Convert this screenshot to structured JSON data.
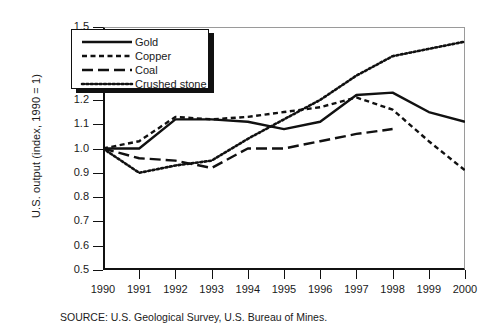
{
  "chart_data": {
    "type": "line",
    "title": "",
    "xlabel": "",
    "ylabel": "U.S. output (index, 1990 = 1)",
    "x": [
      1990,
      1991,
      1992,
      1993,
      1994,
      1995,
      1996,
      1997,
      1998,
      1999,
      2000
    ],
    "xlim": [
      1990,
      2000
    ],
    "ylim": [
      0.5,
      1.5
    ],
    "yticks": [
      "1.5",
      "1.4",
      "1.3",
      "1.2",
      "1.1",
      "1.0",
      "0.9",
      "0.8",
      "0.7",
      "0.6",
      "0.5"
    ],
    "xticks": [
      "1990",
      "1991",
      "1992",
      "1993",
      "1994",
      "1995",
      "1996",
      "1997",
      "1998",
      "1999",
      "2000"
    ],
    "grid": false,
    "legend_position": "upper-left",
    "series": [
      {
        "name": "Gold",
        "style": "solid",
        "color": "#111111",
        "x": [
          1990,
          1991,
          1992,
          1993,
          1994,
          1995,
          1996,
          1997,
          1998,
          1999,
          2000
        ],
        "values": [
          1.0,
          1.0,
          1.12,
          1.12,
          1.11,
          1.08,
          1.11,
          1.22,
          1.23,
          1.15,
          1.11
        ]
      },
      {
        "name": "Copper",
        "style": "dashed-short",
        "color": "#111111",
        "x": [
          1990,
          1991,
          1992,
          1993,
          1994,
          1995,
          1996,
          1997,
          1998,
          1999,
          2000
        ],
        "values": [
          1.0,
          1.03,
          1.13,
          1.12,
          1.13,
          1.15,
          1.17,
          1.21,
          1.16,
          1.03,
          0.91
        ]
      },
      {
        "name": "Coal",
        "style": "dashed-long",
        "color": "#111111",
        "x": [
          1990,
          1991,
          1992,
          1993,
          1994,
          1995,
          1996,
          1997,
          1998
        ],
        "values": [
          1.0,
          0.96,
          0.95,
          0.92,
          1.0,
          1.0,
          1.03,
          1.06,
          1.08
        ]
      },
      {
        "name": "Crushed stone",
        "style": "dotted",
        "color": "#111111",
        "x": [
          1990,
          1991,
          1992,
          1993,
          1994,
          1995,
          1996,
          1997,
          1998,
          1999,
          2000
        ],
        "values": [
          1.0,
          0.9,
          0.93,
          0.95,
          1.04,
          1.12,
          1.2,
          1.3,
          1.38,
          1.41,
          1.44
        ]
      }
    ],
    "source_note": "SOURCE:  U.S. Geological Survey, U.S. Bureau of Mines."
  },
  "legend": {
    "items": [
      {
        "label": "Gold",
        "style": "solid"
      },
      {
        "label": "Copper",
        "style": "dashed-short"
      },
      {
        "label": "Coal",
        "style": "dashed-long"
      },
      {
        "label": "Crushed stone",
        "style": "dotted"
      }
    ]
  }
}
